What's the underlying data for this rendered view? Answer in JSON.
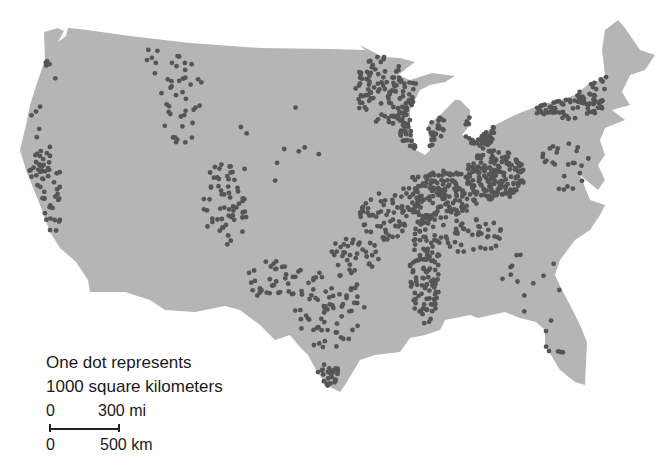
{
  "map": {
    "type": "dot-density",
    "region": "Contiguous United States",
    "land_color": "#b5b5b5",
    "dot_color": "#555555",
    "water_color": "#ffffff",
    "dot_radius": 2.4
  },
  "legend": {
    "line1": "One dot represents",
    "line2": "1000 square kilometers"
  },
  "scale": {
    "mi_start": "0",
    "mi_end": "300 mi",
    "km_start": "0",
    "km_end": "500 km"
  },
  "clusters": [
    {
      "name": "pacific-nw",
      "cx": 50,
      "cy": 70,
      "rx": 12,
      "ry": 10,
      "n": 5
    },
    {
      "name": "oregon-coast",
      "cx": 35,
      "cy": 120,
      "rx": 8,
      "ry": 20,
      "n": 5
    },
    {
      "name": "california-central",
      "cx": 45,
      "cy": 195,
      "rx": 18,
      "ry": 50,
      "n": 55
    },
    {
      "name": "idaho-montana",
      "cx": 182,
      "cy": 100,
      "rx": 22,
      "ry": 45,
      "n": 40
    },
    {
      "name": "montana-west",
      "cx": 155,
      "cy": 60,
      "rx": 10,
      "ry": 15,
      "n": 6
    },
    {
      "name": "colorado",
      "cx": 225,
      "cy": 205,
      "rx": 22,
      "ry": 45,
      "n": 60
    },
    {
      "name": "new-mexico",
      "cx": 275,
      "cy": 280,
      "rx": 30,
      "ry": 20,
      "n": 35
    },
    {
      "name": "texas",
      "cx": 330,
      "cy": 310,
      "rx": 35,
      "ry": 40,
      "n": 70
    },
    {
      "name": "texas-south",
      "cx": 328,
      "cy": 375,
      "rx": 12,
      "ry": 12,
      "n": 25
    },
    {
      "name": "oklahoma",
      "cx": 355,
      "cy": 255,
      "rx": 25,
      "ry": 20,
      "n": 35
    },
    {
      "name": "minnesota",
      "cx": 385,
      "cy": 90,
      "rx": 32,
      "ry": 35,
      "n": 110
    },
    {
      "name": "wisconsin",
      "cx": 420,
      "cy": 125,
      "rx": 25,
      "ry": 25,
      "n": 60
    },
    {
      "name": "iowa-illinois",
      "cx": 440,
      "cy": 195,
      "rx": 40,
      "ry": 25,
      "n": 170
    },
    {
      "name": "indiana-ohio",
      "cx": 495,
      "cy": 175,
      "rx": 30,
      "ry": 25,
      "n": 170
    },
    {
      "name": "michigan",
      "cx": 480,
      "cy": 130,
      "rx": 15,
      "ry": 20,
      "n": 45
    },
    {
      "name": "mississippi-valley",
      "cx": 425,
      "cy": 270,
      "rx": 15,
      "ry": 55,
      "n": 120
    },
    {
      "name": "missouri-kansas",
      "cx": 385,
      "cy": 215,
      "rx": 25,
      "ry": 25,
      "n": 60
    },
    {
      "name": "pennsylvania-ny",
      "cx": 565,
      "cy": 105,
      "rx": 40,
      "ry": 15,
      "n": 80
    },
    {
      "name": "kentucky-tennessee",
      "cx": 470,
      "cy": 235,
      "rx": 35,
      "ry": 18,
      "n": 45
    },
    {
      "name": "virginia",
      "cx": 565,
      "cy": 165,
      "rx": 25,
      "ry": 25,
      "n": 25
    },
    {
      "name": "southeast-sparse",
      "cx": 540,
      "cy": 290,
      "rx": 50,
      "ry": 40,
      "n": 14
    },
    {
      "name": "florida",
      "cx": 555,
      "cy": 340,
      "rx": 15,
      "ry": 18,
      "n": 6
    },
    {
      "name": "great-plains-sparse",
      "cx": 280,
      "cy": 150,
      "rx": 60,
      "ry": 50,
      "n": 10
    },
    {
      "name": "northeast",
      "cx": 600,
      "cy": 80,
      "rx": 12,
      "ry": 15,
      "n": 8
    }
  ]
}
